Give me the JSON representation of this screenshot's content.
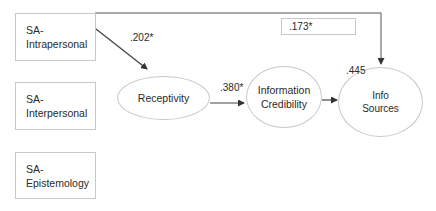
{
  "diagram": {
    "type": "path-model",
    "boxes": [
      {
        "id": "sa-intrapersonal",
        "line1": "SA-",
        "line2": "Intrapersonal"
      },
      {
        "id": "sa-interpersonal",
        "line1": "SA-",
        "line2": "Interpersonal"
      },
      {
        "id": "sa-epistemology",
        "line1": "SA-",
        "line2": "Epistemology"
      }
    ],
    "ellipses": [
      {
        "id": "receptivity",
        "line1": "Receptivity",
        "line2": ""
      },
      {
        "id": "information-credibility",
        "line1": "Information",
        "line2": "Credibility"
      },
      {
        "id": "info-sources",
        "line1": "Info",
        "line2": "Sources"
      }
    ],
    "paths": [
      {
        "from": "SA-Intrapersonal",
        "to": "Receptivity",
        "coefficient": ".202*"
      },
      {
        "from": "Receptivity",
        "to": "Information Credibility",
        "coefficient": ".380*"
      },
      {
        "from": "Information Credibility",
        "to": "Info Sources",
        "coefficient": ".445"
      },
      {
        "from": "SA-Intrapersonal",
        "to": "Info Sources",
        "coefficient": ".173*"
      }
    ]
  }
}
